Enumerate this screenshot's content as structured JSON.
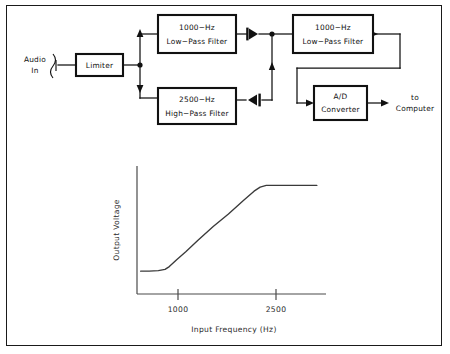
{
  "figure": {
    "border_color": "#1a1a1a",
    "background": "#ffffff"
  },
  "diagram": {
    "input": {
      "label_line1": "Audio",
      "label_line2": "In",
      "connector_icon": "audio-jack-icon"
    },
    "blocks": [
      {
        "id": "limiter",
        "label_line1": "Limiter",
        "label_line2": ""
      },
      {
        "id": "lpf1",
        "label_line1": "1000−Hz",
        "label_line2": "Low−Pass Filter"
      },
      {
        "id": "hpf",
        "label_line1": "2500−Hz",
        "label_line2": "High−Pass Filter"
      },
      {
        "id": "lpf2",
        "label_line1": "1000−Hz",
        "label_line2": "Low−Pass Filter"
      },
      {
        "id": "adc",
        "label_line1": "A/D",
        "label_line2": "Converter"
      }
    ],
    "components": [
      {
        "id": "diode-top",
        "type": "diode",
        "direction": "left"
      },
      {
        "id": "diode-bottom",
        "type": "diode",
        "direction": "right"
      }
    ],
    "output": {
      "label_line1": "to",
      "label_line2": "Computer"
    }
  },
  "chart_data": {
    "type": "line",
    "title": "",
    "xlabel": "Input Frequency (Hz)",
    "ylabel": "Output Voltage",
    "xticks": [
      "1000",
      "2500"
    ],
    "xtick_values": [
      1000,
      2500
    ],
    "yticks": [],
    "grid": false,
    "legend": null,
    "xlim": [
      500,
      3600
    ],
    "ylim": [
      0,
      1.12
    ],
    "series": [
      {
        "name": "Output Voltage vs Input Frequency",
        "x": [
          560,
          700,
          850,
          960,
          1030,
          1150,
          1300,
          1500,
          1750,
          2000,
          2250,
          2420,
          2520,
          2620,
          2800,
          3100,
          3450
        ],
        "y": [
          0.2,
          0.2,
          0.205,
          0.215,
          0.24,
          0.3,
          0.37,
          0.47,
          0.59,
          0.7,
          0.82,
          0.9,
          0.935,
          0.95,
          0.95,
          0.95,
          0.95
        ]
      }
    ]
  }
}
